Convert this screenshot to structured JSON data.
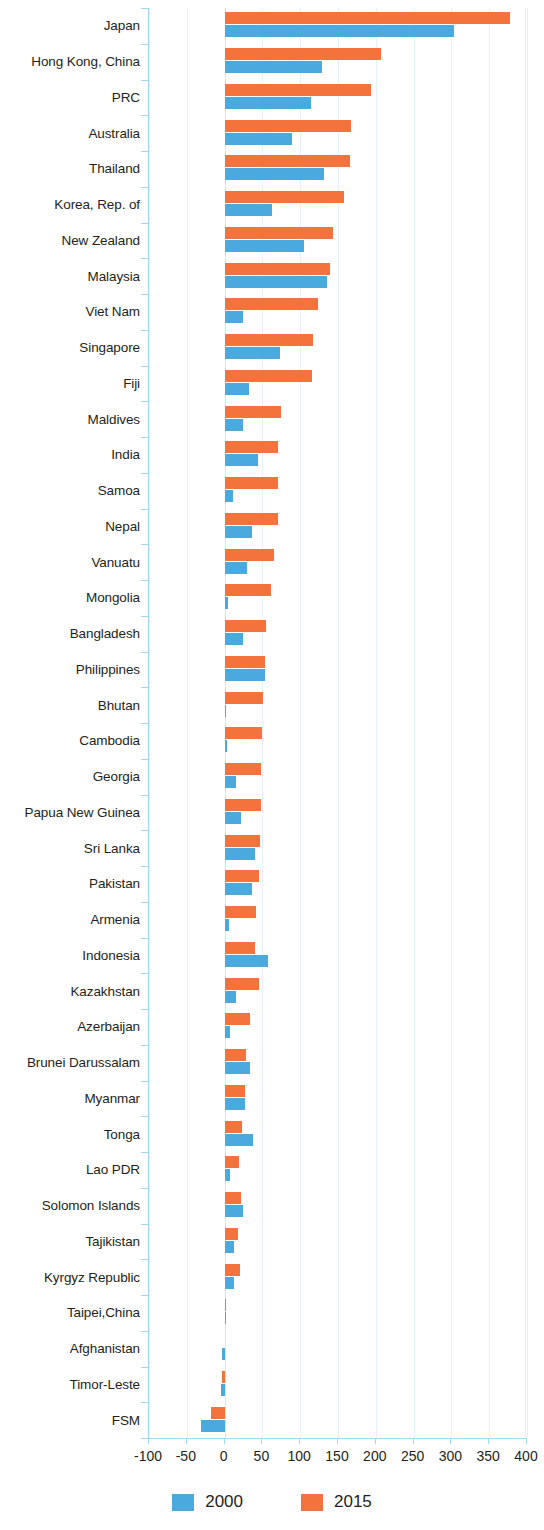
{
  "chart_data": {
    "type": "bar",
    "orientation": "horizontal",
    "title": "",
    "subtitle": "",
    "xlabel": "",
    "ylabel": "",
    "xlim": [
      -100,
      400
    ],
    "xticks": [
      -100,
      -50,
      0,
      50,
      100,
      150,
      200,
      250,
      300,
      350,
      400
    ],
    "xticklabels": [
      "-100",
      "-50",
      "0",
      "50",
      "100",
      "150",
      "200",
      "250",
      "300",
      "350",
      "400"
    ],
    "grid": true,
    "legend_position": "bottom",
    "colors": {
      "2000": "#4aa9dd",
      "2015": "#f4733c",
      "axis": "#9fd9ef",
      "grid": "#e3f3fb",
      "text": "#231f20"
    },
    "categories": [
      "Japan",
      "Hong Kong, China",
      "PRC",
      "Australia",
      "Thailand",
      "Korea, Rep. of",
      "New Zealand",
      "Malaysia",
      "Viet Nam",
      "Singapore",
      "Fiji",
      "Maldives",
      "India",
      "Samoa",
      "Nepal",
      "Vanuatu",
      "Mongolia",
      "Bangladesh",
      "Philippines",
      "Bhutan",
      "Cambodia",
      "Georgia",
      "Papua New Guinea",
      "Sri Lanka",
      "Pakistan",
      "Armenia",
      "Indonesia",
      "Kazakhstan",
      "Azerbaijan",
      "Brunei Darussalam",
      "Myanmar",
      "Tonga",
      "Lao PDR",
      "Solomon Islands",
      "Tajikistan",
      "Kyrgyz Republic",
      "Taipei,China",
      "Afghanistan",
      "Timor-Leste",
      "FSM"
    ],
    "series": [
      {
        "name": "2000",
        "color": "#4aa9dd",
        "values": [
          303,
          129,
          114,
          89,
          131,
          63,
          105,
          136,
          25,
          73,
          32,
          25,
          44,
          11,
          36,
          30,
          4,
          25,
          53,
          1,
          3,
          15,
          22,
          40,
          36,
          6,
          58,
          15,
          7,
          34,
          27,
          37,
          7,
          25,
          13,
          12,
          1,
          -3,
          -5,
          -31
        ]
      },
      {
        "name": "2015",
        "color": "#f4733c",
        "values": [
          378,
          207,
          193,
          167,
          166,
          158,
          144,
          139,
          123,
          117,
          116,
          74,
          71,
          71,
          70,
          65,
          62,
          55,
          54,
          51,
          49,
          48,
          48,
          47,
          45,
          42,
          40,
          46,
          33,
          28,
          27,
          23,
          19,
          22,
          18,
          20,
          2,
          0,
          -4,
          -18
        ]
      }
    ]
  },
  "legend": {
    "items": [
      {
        "label": "2000",
        "color": "#4aa9dd"
      },
      {
        "label": "2015",
        "color": "#f4733c"
      }
    ]
  }
}
